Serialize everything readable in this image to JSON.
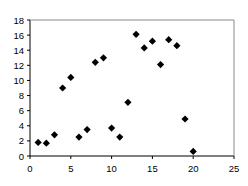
{
  "chart_data": {
    "type": "scatter",
    "title": "",
    "xlabel": "",
    "ylabel": "",
    "xlim": [
      0,
      25
    ],
    "ylim": [
      0,
      18
    ],
    "x_ticks": [
      0,
      5,
      10,
      15,
      20,
      25
    ],
    "y_ticks": [
      0,
      2,
      4,
      6,
      8,
      10,
      12,
      14,
      16,
      18
    ],
    "grid": false,
    "legend": null,
    "marker": "diamond",
    "marker_color": "#000000",
    "series": [
      {
        "name": "Series 1",
        "points": [
          {
            "x": 1,
            "y": 1.8
          },
          {
            "x": 2,
            "y": 1.7
          },
          {
            "x": 3,
            "y": 2.8
          },
          {
            "x": 4,
            "y": 9.0
          },
          {
            "x": 5,
            "y": 10.4
          },
          {
            "x": 6,
            "y": 2.5
          },
          {
            "x": 7,
            "y": 3.5
          },
          {
            "x": 8,
            "y": 12.4
          },
          {
            "x": 9,
            "y": 13.0
          },
          {
            "x": 10,
            "y": 3.7
          },
          {
            "x": 11,
            "y": 2.5
          },
          {
            "x": 12,
            "y": 7.1
          },
          {
            "x": 13,
            "y": 16.1
          },
          {
            "x": 14,
            "y": 14.3
          },
          {
            "x": 15,
            "y": 15.2
          },
          {
            "x": 16,
            "y": 12.1
          },
          {
            "x": 17,
            "y": 15.4
          },
          {
            "x": 18,
            "y": 14.6
          },
          {
            "x": 19,
            "y": 4.9
          },
          {
            "x": 20,
            "y": 0.6
          }
        ]
      }
    ]
  }
}
